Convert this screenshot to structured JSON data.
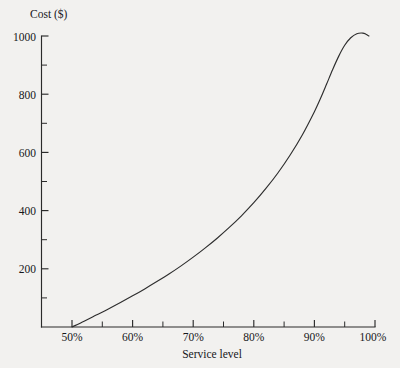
{
  "chart_data": {
    "type": "line",
    "title": "",
    "ylabel": "Cost ($)",
    "xlabel": "Service level",
    "xlim": [
      45,
      100
    ],
    "ylim": [
      0,
      1000
    ],
    "grid": false,
    "legend": null,
    "x_tick_labels": [
      "50%",
      "60%",
      "70%",
      "80%",
      "90%",
      "100%"
    ],
    "x_tick_values": [
      50,
      60,
      70,
      80,
      90,
      100
    ],
    "x_minor_ticks": [
      55,
      65,
      75,
      85,
      95
    ],
    "y_tick_labels": [
      "1000",
      "800",
      "600",
      "400",
      "200"
    ],
    "y_tick_values": [
      1000,
      800,
      600,
      400,
      200
    ],
    "y_minor_ticks": [
      900,
      700,
      500,
      300,
      100
    ],
    "series": [
      {
        "name": "Cost",
        "x": [
          50,
          52,
          54,
          56,
          58,
          60,
          62,
          64,
          66,
          68,
          70,
          72,
          74,
          76,
          78,
          80,
          82,
          84,
          86,
          88,
          90,
          91,
          92,
          93,
          94,
          95,
          96,
          97,
          98,
          98.5,
          99
        ],
        "values": [
          0,
          20,
          41,
          62,
          84,
          107,
          131,
          156,
          182,
          210,
          240,
          272,
          306,
          343,
          383,
          427,
          476,
          530,
          591,
          660,
          740,
          785,
          834,
          884,
          930,
          968,
          994,
          1008,
          1010,
          1006,
          1000
        ]
      }
    ]
  },
  "axis_titles": {
    "y": "Cost ($)",
    "x": "Service level"
  }
}
